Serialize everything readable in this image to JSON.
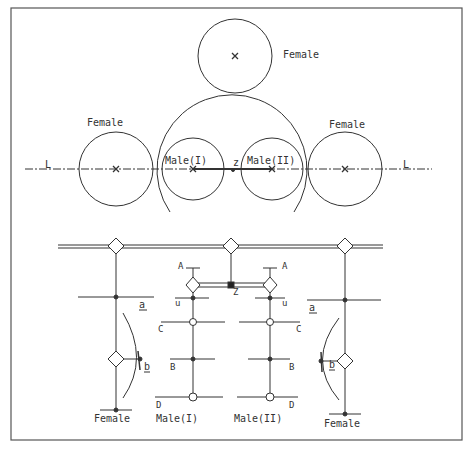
{
  "top_view": {
    "labels": {
      "female_top": "Female",
      "female_left": "Female",
      "female_right": "Female",
      "male1": "Male(I)",
      "male2": "Male(II)",
      "z": "z",
      "l_left": "L",
      "l_right": "L"
    }
  },
  "bottom_view": {
    "labels": {
      "a_left": "a",
      "b_left": "b",
      "a_right": "a",
      "b_right": "b",
      "A1": "A",
      "A2": "A",
      "u1": "u",
      "u2": "u",
      "C1": "C",
      "C2": "C",
      "B1": "B",
      "B2": "B",
      "D1": "D",
      "D2": "D",
      "Z": "Z",
      "female_left": "Female",
      "male1": "Male(I)",
      "male2": "Male(II)",
      "female_right": "Female"
    }
  }
}
